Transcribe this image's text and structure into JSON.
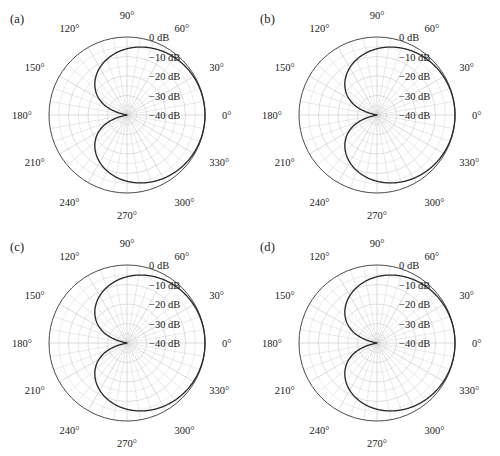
{
  "figure": {
    "panels": [
      {
        "id": "a",
        "label": "(a)"
      },
      {
        "id": "b",
        "label": "(b)"
      },
      {
        "id": "c",
        "label": "(c)"
      },
      {
        "id": "d",
        "label": "(d)"
      }
    ]
  },
  "chart_data": [
    {
      "type": "line",
      "plot_kind": "polar",
      "panel": "(a)",
      "title": "",
      "xlabel": "",
      "ylabel": "",
      "angular_unit": "degrees",
      "angular_tick_labels": [
        "0°",
        "30°",
        "60°",
        "90°",
        "120°",
        "150°",
        "180°",
        "210°",
        "240°",
        "270°",
        "300°",
        "330°"
      ],
      "angular_ticks": [
        0,
        30,
        60,
        90,
        120,
        150,
        180,
        210,
        240,
        270,
        300,
        330
      ],
      "angular_minor_step": 10,
      "radial_tick_labels": [
        "0 dB",
        "−10 dB",
        "−20 dB",
        "−30 dB",
        "−40 dB"
      ],
      "radial_ticks_db": [
        0,
        -10,
        -20,
        -30,
        -40
      ],
      "rlim_db": [
        -40,
        0
      ],
      "grid": true,
      "legend": "none",
      "series": [
        {
          "name": "radiation-pattern",
          "model": "cardioid",
          "angles_deg": [
            0,
            10,
            20,
            30,
            40,
            50,
            60,
            70,
            80,
            90,
            100,
            110,
            120,
            130,
            140,
            150,
            160,
            170,
            180,
            190,
            200,
            210,
            220,
            230,
            240,
            250,
            260,
            270,
            280,
            290,
            300,
            310,
            320,
            330,
            340,
            350,
            360
          ],
          "values_db": [
            0.0,
            -0.07,
            -0.27,
            -0.62,
            -1.12,
            -1.79,
            -2.65,
            -3.74,
            -5.09,
            -6.78,
            -8.91,
            -11.66,
            -15.36,
            -20.66,
            -29.23,
            -40.0,
            -29.23,
            -20.66,
            -15.36,
            -20.66,
            -29.23,
            -40.0,
            -29.23,
            -20.66,
            -15.36,
            -11.66,
            -8.91,
            -6.78,
            -5.09,
            -3.74,
            -2.65,
            -1.79,
            -1.12,
            -0.62,
            -0.27,
            -0.07,
            0.0
          ]
        }
      ]
    },
    {
      "type": "line",
      "plot_kind": "polar",
      "panel": "(b)",
      "title": "",
      "xlabel": "",
      "ylabel": "",
      "angular_unit": "degrees",
      "angular_tick_labels": [
        "0°",
        "30°",
        "60°",
        "90°",
        "120°",
        "150°",
        "180°",
        "210°",
        "240°",
        "270°",
        "300°",
        "330°"
      ],
      "angular_ticks": [
        0,
        30,
        60,
        90,
        120,
        150,
        180,
        210,
        240,
        270,
        300,
        330
      ],
      "angular_minor_step": 10,
      "radial_tick_labels": [
        "0 dB",
        "−10 dB",
        "−20 dB",
        "−30 dB",
        "−40 dB"
      ],
      "radial_ticks_db": [
        0,
        -10,
        -20,
        -30,
        -40
      ],
      "rlim_db": [
        -40,
        0
      ],
      "grid": true,
      "legend": "none",
      "series": [
        {
          "name": "radiation-pattern",
          "model": "cardioid",
          "angles_deg": [
            0,
            10,
            20,
            30,
            40,
            50,
            60,
            70,
            80,
            90,
            100,
            110,
            120,
            130,
            140,
            150,
            160,
            170,
            180,
            190,
            200,
            210,
            220,
            230,
            240,
            250,
            260,
            270,
            280,
            290,
            300,
            310,
            320,
            330,
            340,
            350,
            360
          ],
          "values_db": [
            0.0,
            -0.07,
            -0.27,
            -0.62,
            -1.12,
            -1.79,
            -2.65,
            -3.74,
            -5.09,
            -6.78,
            -8.91,
            -11.66,
            -15.36,
            -20.66,
            -29.23,
            -40.0,
            -29.23,
            -20.66,
            -15.36,
            -20.66,
            -29.23,
            -40.0,
            -29.23,
            -20.66,
            -15.36,
            -11.66,
            -8.91,
            -6.78,
            -5.09,
            -3.74,
            -2.65,
            -1.79,
            -1.12,
            -0.62,
            -0.27,
            -0.07,
            0.0
          ]
        }
      ]
    },
    {
      "type": "line",
      "plot_kind": "polar",
      "panel": "(c)",
      "title": "",
      "xlabel": "",
      "ylabel": "",
      "angular_unit": "degrees",
      "angular_tick_labels": [
        "0°",
        "30°",
        "60°",
        "90°",
        "120°",
        "150°",
        "180°",
        "210°",
        "240°",
        "270°",
        "300°",
        "330°"
      ],
      "angular_ticks": [
        0,
        30,
        60,
        90,
        120,
        150,
        180,
        210,
        240,
        270,
        300,
        330
      ],
      "angular_minor_step": 10,
      "radial_tick_labels": [
        "0 dB",
        "−10 dB",
        "−20 dB",
        "−30 dB",
        "−40 dB"
      ],
      "radial_ticks_db": [
        0,
        -10,
        -20,
        -30,
        -40
      ],
      "rlim_db": [
        -40,
        0
      ],
      "grid": true,
      "legend": "none",
      "series": [
        {
          "name": "radiation-pattern",
          "model": "cardioid",
          "angles_deg": [
            0,
            10,
            20,
            30,
            40,
            50,
            60,
            70,
            80,
            90,
            100,
            110,
            120,
            130,
            140,
            150,
            160,
            170,
            180,
            190,
            200,
            210,
            220,
            230,
            240,
            250,
            260,
            270,
            280,
            290,
            300,
            310,
            320,
            330,
            340,
            350,
            360
          ],
          "values_db": [
            0.0,
            -0.07,
            -0.27,
            -0.62,
            -1.12,
            -1.79,
            -2.65,
            -3.74,
            -5.09,
            -6.78,
            -8.91,
            -11.66,
            -15.36,
            -20.66,
            -29.23,
            -40.0,
            -29.23,
            -20.66,
            -15.36,
            -20.66,
            -29.23,
            -40.0,
            -29.23,
            -20.66,
            -15.36,
            -11.66,
            -8.91,
            -6.78,
            -5.09,
            -3.74,
            -2.65,
            -1.79,
            -1.12,
            -0.62,
            -0.27,
            -0.07,
            0.0
          ]
        }
      ]
    },
    {
      "type": "line",
      "plot_kind": "polar",
      "panel": "(d)",
      "title": "",
      "xlabel": "",
      "ylabel": "",
      "angular_unit": "degrees",
      "angular_tick_labels": [
        "0°",
        "30°",
        "60°",
        "90°",
        "120°",
        "150°",
        "180°",
        "210°",
        "240°",
        "270°",
        "300°",
        "330°"
      ],
      "angular_ticks": [
        0,
        30,
        60,
        90,
        120,
        150,
        180,
        210,
        240,
        270,
        300,
        330
      ],
      "angular_minor_step": 10,
      "radial_tick_labels": [
        "0 dB",
        "−10 dB",
        "−20 dB",
        "−30 dB",
        "−40 dB"
      ],
      "radial_ticks_db": [
        0,
        -10,
        -20,
        -30,
        -40
      ],
      "rlim_db": [
        -40,
        0
      ],
      "grid": true,
      "legend": "none",
      "series": [
        {
          "name": "radiation-pattern",
          "model": "cardioid",
          "angles_deg": [
            0,
            10,
            20,
            30,
            40,
            50,
            60,
            70,
            80,
            90,
            100,
            110,
            120,
            130,
            140,
            150,
            160,
            170,
            180,
            190,
            200,
            210,
            220,
            230,
            240,
            250,
            260,
            270,
            280,
            290,
            300,
            310,
            320,
            330,
            340,
            350,
            360
          ],
          "values_db": [
            0.0,
            -0.07,
            -0.27,
            -0.62,
            -1.12,
            -1.79,
            -2.65,
            -3.74,
            -5.09,
            -6.78,
            -8.91,
            -11.66,
            -15.36,
            -20.66,
            -29.23,
            -40.0,
            -29.23,
            -20.66,
            -15.36,
            -20.66,
            -29.23,
            -40.0,
            -29.23,
            -20.66,
            -15.36,
            -11.66,
            -8.91,
            -6.78,
            -5.09,
            -3.74,
            -2.65,
            -1.79,
            -1.12,
            -0.62,
            -0.27,
            -0.07,
            0.0
          ]
        }
      ]
    }
  ]
}
